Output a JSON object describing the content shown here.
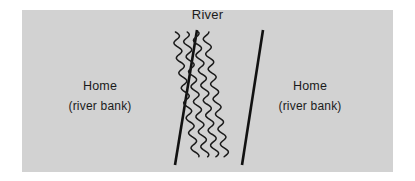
{
  "figure": {
    "title": "River",
    "background_color": "#d2d2d2",
    "page_color": "#ffffff",
    "ink_color": "#111111"
  },
  "labels": {
    "river": "River",
    "left_bank": {
      "main": "Home",
      "sub": "(river bank)"
    },
    "right_bank": {
      "main": "Home",
      "sub": "(river bank)"
    }
  },
  "diagram_data": {
    "type": "schematic",
    "description": "A river separating two river banks, each labelled Home",
    "panel": {
      "x": 22,
      "y": 10,
      "width": 371,
      "height": 162
    },
    "bank_lines": [
      {
        "name": "left-bank-line",
        "x1": 153,
        "y1": 155,
        "x2": 175,
        "y2": 20
      },
      {
        "name": "right-bank-line",
        "x1": 220,
        "y1": 155,
        "x2": 241,
        "y2": 20
      }
    ],
    "river_waves": {
      "count": 4,
      "x_positions": [
        174,
        184,
        194,
        204
      ],
      "y_top": 22,
      "y_bottom": 148,
      "amplitude": 3.4,
      "period": 15
    }
  }
}
